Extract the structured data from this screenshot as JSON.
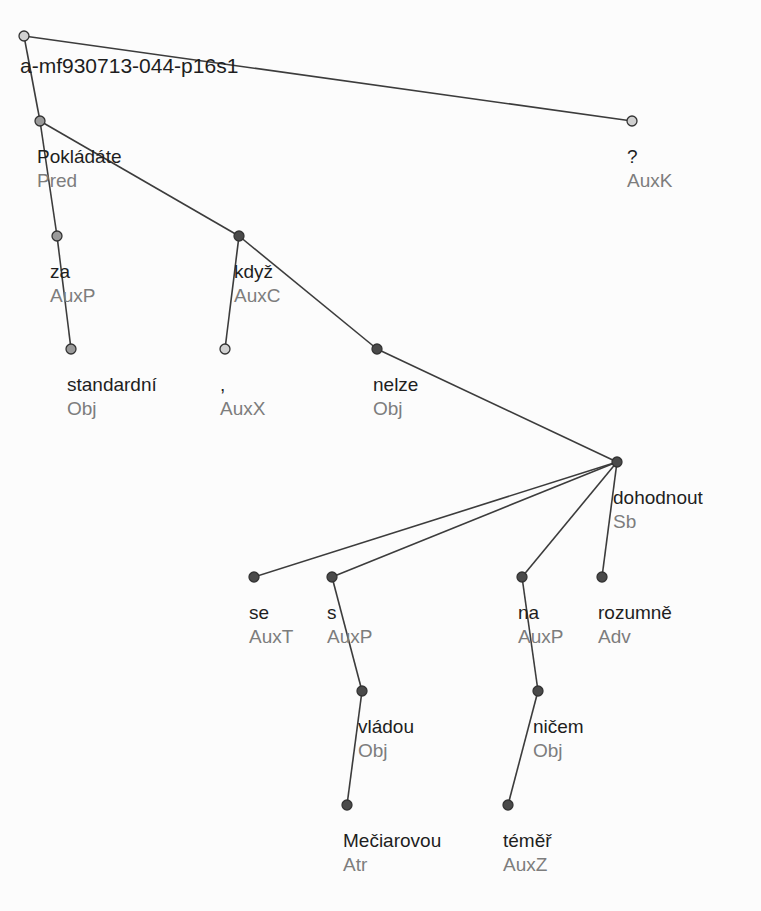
{
  "tree": {
    "root_id": "a-mf930713-044-p16s1",
    "colors": {
      "edge": "#3c3c3c",
      "node_dark": "#4a4a4a",
      "node_gray": "#9a9a9a",
      "node_hollow": "#d0d0d0",
      "node_stroke": "#333333",
      "word": "#1e1e1e",
      "func": "#7d7d7d"
    },
    "nodes": [
      {
        "id": "root",
        "word": "a-mf930713-044-p16s1",
        "func": "",
        "x": 24,
        "y": 36,
        "style": "hollow",
        "lx": 20,
        "ly": 57
      },
      {
        "id": "n1",
        "word": "Pokládáte",
        "func": "Pred",
        "x": 40,
        "y": 121,
        "style": "gray",
        "lx": 37,
        "ly": 147
      },
      {
        "id": "n2",
        "word": "za",
        "func": "AuxP",
        "x": 57,
        "y": 236,
        "style": "gray",
        "lx": 50,
        "ly": 262
      },
      {
        "id": "n3",
        "word": "standardní",
        "func": "Obj",
        "x": 71,
        "y": 349,
        "style": "gray",
        "lx": 67,
        "ly": 375
      },
      {
        "id": "n4",
        "word": "když",
        "func": "AuxC",
        "x": 239,
        "y": 236,
        "style": "dark",
        "lx": 234,
        "ly": 262
      },
      {
        "id": "n5",
        "word": ",",
        "func": "AuxX",
        "x": 225,
        "y": 349,
        "style": "hollow",
        "lx": 220,
        "ly": 375
      },
      {
        "id": "n6",
        "word": "nelze",
        "func": "Obj",
        "x": 377,
        "y": 349,
        "style": "dark",
        "lx": 373,
        "ly": 375
      },
      {
        "id": "n7",
        "word": "dohodnout",
        "func": "Sb",
        "x": 617,
        "y": 462,
        "style": "dark",
        "lx": 613,
        "ly": 488
      },
      {
        "id": "n8",
        "word": "se",
        "func": "AuxT",
        "x": 254,
        "y": 577,
        "style": "dark",
        "lx": 249,
        "ly": 603
      },
      {
        "id": "n9",
        "word": "s",
        "func": "AuxP",
        "x": 332,
        "y": 577,
        "style": "dark",
        "lx": 327,
        "ly": 603
      },
      {
        "id": "n10",
        "word": "vládou",
        "func": "Obj",
        "x": 362,
        "y": 691,
        "style": "dark",
        "lx": 358,
        "ly": 717
      },
      {
        "id": "n11",
        "word": "Mečiarovou",
        "func": "Atr",
        "x": 347,
        "y": 805,
        "style": "dark",
        "lx": 343,
        "ly": 831
      },
      {
        "id": "n12",
        "word": "na",
        "func": "AuxP",
        "x": 522,
        "y": 577,
        "style": "dark",
        "lx": 518,
        "ly": 603
      },
      {
        "id": "n13",
        "word": "ničem",
        "func": "Obj",
        "x": 538,
        "y": 691,
        "style": "dark",
        "lx": 533,
        "ly": 717
      },
      {
        "id": "n14",
        "word": "téměř",
        "func": "AuxZ",
        "x": 508,
        "y": 805,
        "style": "dark",
        "lx": 503,
        "ly": 831
      },
      {
        "id": "n15",
        "word": "rozumně",
        "func": "Adv",
        "x": 602,
        "y": 577,
        "style": "dark",
        "lx": 598,
        "ly": 603
      },
      {
        "id": "n16",
        "word": "?",
        "func": "AuxK",
        "x": 632,
        "y": 121,
        "style": "hollow",
        "lx": 627,
        "ly": 147
      }
    ],
    "edges": [
      {
        "from": "root",
        "to": "n1"
      },
      {
        "from": "root",
        "to": "n16"
      },
      {
        "from": "n1",
        "to": "n2"
      },
      {
        "from": "n1",
        "to": "n4"
      },
      {
        "from": "n2",
        "to": "n3"
      },
      {
        "from": "n4",
        "to": "n5"
      },
      {
        "from": "n4",
        "to": "n6"
      },
      {
        "from": "n6",
        "to": "n7"
      },
      {
        "from": "n7",
        "to": "n8"
      },
      {
        "from": "n7",
        "to": "n9"
      },
      {
        "from": "n7",
        "to": "n12"
      },
      {
        "from": "n7",
        "to": "n15"
      },
      {
        "from": "n9",
        "to": "n10"
      },
      {
        "from": "n10",
        "to": "n11"
      },
      {
        "from": "n12",
        "to": "n13"
      },
      {
        "from": "n13",
        "to": "n14"
      }
    ]
  }
}
